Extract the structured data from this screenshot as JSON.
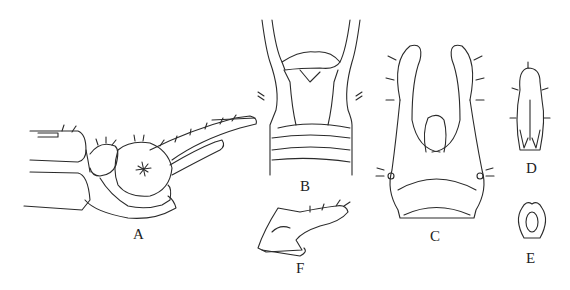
{
  "figure": {
    "type": "scientific line illustration",
    "panels": [
      {
        "id": "A",
        "label": "A",
        "description": "lateral view of genitalia"
      },
      {
        "id": "B",
        "label": "B",
        "description": "dorsal view of apical segment"
      },
      {
        "id": "C",
        "label": "C",
        "description": "ventral view of genitalia with claspers"
      },
      {
        "id": "D",
        "label": "D",
        "description": "aedeagus detail"
      },
      {
        "id": "E",
        "label": "E",
        "description": "ring structure detail"
      },
      {
        "id": "F",
        "label": "F",
        "description": "lateral detail of aedeagus"
      }
    ]
  }
}
